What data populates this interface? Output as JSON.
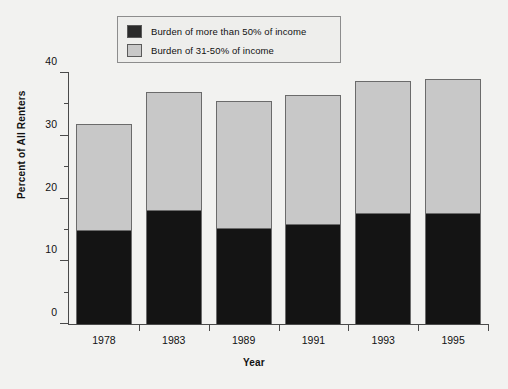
{
  "chart_data": {
    "type": "bar",
    "subtype": "stacked",
    "title": "",
    "xlabel": "Year",
    "ylabel": "Percent of All Renters",
    "categories": [
      "1978",
      "1983",
      "1989",
      "1991",
      "1993",
      "1995"
    ],
    "series": [
      {
        "name": "Burden of more than 50% of income",
        "color": "#141414",
        "values": [
          15.0,
          18.3,
          15.4,
          16.0,
          17.8,
          17.8
        ]
      },
      {
        "name": "Burden of 31-50% of income",
        "color": "#c8c8c8",
        "values": [
          16.9,
          18.7,
          20.1,
          20.5,
          20.9,
          21.2
        ]
      }
    ],
    "totals": [
      31.9,
      37.0,
      35.5,
      36.5,
      38.7,
      39.0
    ],
    "ylim": [
      0,
      40
    ],
    "y_ticks_major": [
      0,
      10,
      20,
      30,
      40
    ],
    "y_ticks_minor": [
      5,
      15,
      25,
      35
    ],
    "grid": false,
    "legend_position": "top-center"
  },
  "legend": {
    "entries": [
      {
        "label": "Burden of more than 50% of income",
        "color": "#2b2b2b"
      },
      {
        "label": "Burden of 31-50% of income",
        "color": "#c8c8c8"
      }
    ]
  },
  "axes": {
    "y_title": "Percent of All Renters",
    "x_title": "Year",
    "y_tick_labels": [
      "0",
      "10",
      "20",
      "30",
      "40"
    ],
    "x_tick_labels": [
      "1978",
      "1983",
      "1989",
      "1991",
      "1993",
      "1995"
    ]
  },
  "colors": {
    "background": "#f2f2f0",
    "axis": "#4a4a4a",
    "dark_segment": "#141414",
    "light_segment": "#c8c8c8",
    "bar_outline": "#6b6b6b",
    "legend_bg": "#eeeeec",
    "legend_border": "#8d8d8d",
    "text": "#111111"
  }
}
